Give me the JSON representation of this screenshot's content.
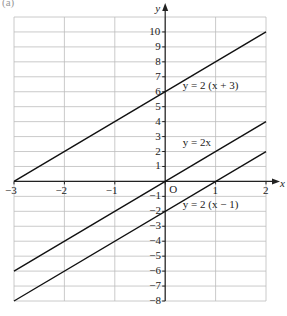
{
  "part_label": "(a)",
  "chart_data": {
    "type": "line",
    "title": "",
    "xlabel": "x",
    "ylabel": "y",
    "xlim": [
      -3,
      2
    ],
    "ylim": [
      -8,
      11
    ],
    "grid": true,
    "x_ticks": [
      -3,
      -2,
      -1,
      0,
      1,
      2
    ],
    "x_tick_labels": [
      "−3",
      "−2",
      "−1",
      "",
      "1",
      "2"
    ],
    "y_ticks": [
      -8,
      -7,
      -6,
      -5,
      -4,
      -3,
      -2,
      -1,
      1,
      2,
      3,
      4,
      5,
      6,
      7,
      8,
      9,
      10
    ],
    "origin_label": "O",
    "series": [
      {
        "name": "y = 2 (x + 3)",
        "x": [
          -3,
          2
        ],
        "y": [
          0,
          10
        ]
      },
      {
        "name": "y = 2x",
        "x": [
          -3,
          2
        ],
        "y": [
          -6,
          4
        ]
      },
      {
        "name": "y = 2 (x − 1)",
        "x": [
          -3,
          2
        ],
        "y": [
          -8,
          2
        ]
      }
    ],
    "annotations": [
      {
        "text": "y = 2 (x + 3)",
        "x": 0.35,
        "y": 6
      },
      {
        "text": "y = 2x",
        "x": 0.35,
        "y": 2.2
      },
      {
        "text": "y = 2 (x − 1)",
        "x": 0.35,
        "y": -2
      }
    ]
  },
  "colors": {
    "grid": "#bdbdbd",
    "axis": "#222222",
    "line": "#111111"
  }
}
